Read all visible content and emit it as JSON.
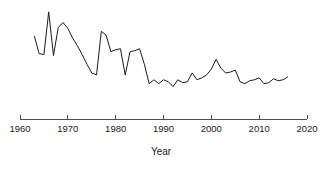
{
  "chart_data": {
    "type": "line",
    "title": "",
    "xlabel": "Year",
    "ylabel": "",
    "grid": false,
    "legend": null,
    "xlim": [
      1960,
      2020
    ],
    "ylim": [
      0,
      100
    ],
    "xticks": [
      1960,
      1970,
      1980,
      1990,
      2000,
      2010,
      2020
    ],
    "xtick_labels": [
      "1960",
      "1970",
      "1980",
      "1990",
      "2000",
      "2010",
      "2020"
    ],
    "yticks": [],
    "ytick_labels": [],
    "series": [
      {
        "name": "value",
        "x": [
          1963,
          1964,
          1965,
          1966,
          1967,
          1968,
          1969,
          1970,
          1971,
          1972,
          1973,
          1974,
          1975,
          1976,
          1977,
          1978,
          1979,
          1980,
          1981,
          1982,
          1983,
          1984,
          1985,
          1986,
          1987,
          1988,
          1989,
          1990,
          1991,
          1992,
          1993,
          1994,
          1995,
          1996,
          1997,
          1998,
          1999,
          2000,
          2001,
          2002,
          2003,
          2004,
          2005,
          2006,
          2007,
          2008,
          2009,
          2010,
          2011,
          2012,
          2013,
          2014,
          2015,
          2016
        ],
        "values": [
          71,
          53,
          52,
          96,
          51,
          80,
          85,
          79,
          69,
          61,
          52,
          42,
          33,
          31,
          76,
          72,
          55,
          57,
          58,
          31,
          55,
          56,
          58,
          42,
          22,
          26,
          22,
          26,
          24,
          19,
          26,
          23,
          24,
          33,
          26,
          28,
          31,
          37,
          47,
          38,
          33,
          34,
          36,
          24,
          22,
          25,
          26,
          28,
          22,
          23,
          27,
          25,
          26,
          29
        ]
      }
    ]
  },
  "axis": {
    "x_title": "Year"
  },
  "geometry": {
    "plot_left": 20,
    "plot_right": 307,
    "axis_y": 119,
    "tick_len": 4,
    "y_top": 8,
    "y_bottom": 105
  }
}
